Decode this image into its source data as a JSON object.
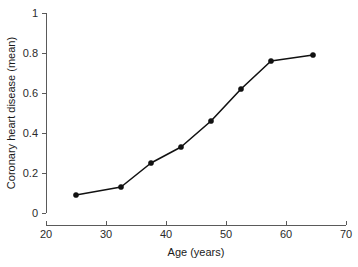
{
  "chart_data": {
    "type": "line",
    "title": "",
    "subtitle": "",
    "xlabel": "Age (years)",
    "ylabel": "Coronary heart disease (mean)",
    "xlim": [
      20,
      70
    ],
    "ylim": [
      0,
      1
    ],
    "grid": false,
    "legend": null,
    "legend_position": "none",
    "xticks": [
      20,
      30,
      40,
      50,
      60,
      70
    ],
    "xtick_labels": [
      "20",
      "30",
      "40",
      "50",
      "60",
      "70"
    ],
    "yticks": [
      0,
      0.2,
      0.4,
      0.6,
      0.8,
      1
    ],
    "ytick_labels": [
      "0",
      "0.2",
      "0.4",
      "0.6",
      "0.8",
      "1"
    ],
    "marker": "filled-circle",
    "line_color": "#111111",
    "marker_color": "#111111",
    "x": [
      25,
      32.5,
      37.5,
      42.5,
      47.5,
      52.5,
      57.5,
      64.5
    ],
    "values": [
      0.09,
      0.13,
      0.25,
      0.33,
      0.46,
      0.62,
      0.76,
      0.79
    ],
    "points": [
      {
        "x": 25,
        "y": 0.09
      },
      {
        "x": 32.5,
        "y": 0.13
      },
      {
        "x": 37.5,
        "y": 0.25
      },
      {
        "x": 42.5,
        "y": 0.33
      },
      {
        "x": 47.5,
        "y": 0.46
      },
      {
        "x": 52.5,
        "y": 0.62
      },
      {
        "x": 57.5,
        "y": 0.76
      },
      {
        "x": 64.5,
        "y": 0.79
      }
    ]
  }
}
